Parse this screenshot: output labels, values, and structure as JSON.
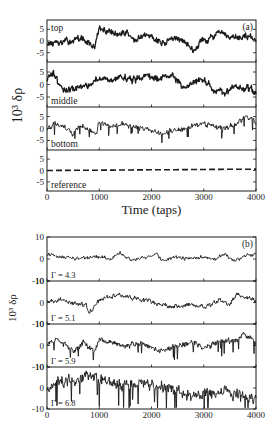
{
  "figure": {
    "width": 279,
    "height": 422,
    "ink_color": "#1a1a1a",
    "background": "#ffffff"
  },
  "chart_data": [
    {
      "type": "line",
      "panel_label": "(a)",
      "title": "",
      "xlabel": "Time (taps)",
      "ylabel": "10³ δρ",
      "xlim": [
        0,
        4000
      ],
      "x_ticks": [
        0,
        1000,
        2000,
        3000,
        4000
      ],
      "x_tick_labels": [
        "0",
        "1000",
        "2000",
        "3000",
        "4000"
      ],
      "grid": false,
      "legend": "none (inline row labels)",
      "frame": {
        "left": 47,
        "right": 256,
        "top": 20,
        "bottom": 191
      },
      "row_bounds": [
        20,
        62,
        107,
        150,
        191
      ],
      "series": [
        {
          "name": "top",
          "ylim": [
            -9,
            9
          ],
          "y_ticks": [
            -5,
            0,
            5
          ],
          "y_tick_labels": [
            "-5",
            "0",
            "5"
          ],
          "noise": 1.6,
          "style": "solid",
          "keypoints": [
            [
              0,
              -1
            ],
            [
              250,
              -1
            ],
            [
              500,
              0.5
            ],
            [
              700,
              1
            ],
            [
              900,
              -3
            ],
            [
              1000,
              5
            ],
            [
              1200,
              4
            ],
            [
              1400,
              2.5
            ],
            [
              1500,
              4
            ],
            [
              1700,
              0
            ],
            [
              1850,
              2
            ],
            [
              2000,
              2.5
            ],
            [
              2200,
              -1
            ],
            [
              2400,
              1
            ],
            [
              2600,
              0.5
            ],
            [
              2800,
              -4
            ],
            [
              2950,
              0
            ],
            [
              3100,
              1
            ],
            [
              3300,
              3.5
            ],
            [
              3500,
              1
            ],
            [
              3700,
              1.5
            ],
            [
              3850,
              2.5
            ],
            [
              4000,
              0
            ]
          ]
        },
        {
          "name": "middle",
          "ylim": [
            -9,
            9
          ],
          "y_ticks": [
            -5,
            0,
            5
          ],
          "y_tick_labels": [
            "-5",
            "0",
            "5"
          ],
          "noise": 1.6,
          "style": "solid",
          "keypoints": [
            [
              0,
              2
            ],
            [
              100,
              5
            ],
            [
              200,
              1
            ],
            [
              400,
              -3
            ],
            [
              600,
              -1
            ],
            [
              800,
              0
            ],
            [
              1000,
              3
            ],
            [
              1200,
              1
            ],
            [
              1300,
              3
            ],
            [
              1500,
              2
            ],
            [
              1700,
              2
            ],
            [
              1900,
              4
            ],
            [
              2000,
              3
            ],
            [
              2200,
              2
            ],
            [
              2400,
              4
            ],
            [
              2600,
              -1
            ],
            [
              2800,
              1
            ],
            [
              3000,
              2
            ],
            [
              3200,
              -2
            ],
            [
              3400,
              -4
            ],
            [
              3600,
              -1
            ],
            [
              3800,
              -1
            ],
            [
              4000,
              -3
            ]
          ]
        },
        {
          "name": "bottom",
          "ylim": [
            -9,
            9
          ],
          "y_ticks": [
            -5,
            0,
            5
          ],
          "y_tick_labels": [
            "-5",
            "0",
            "5"
          ],
          "noise": 1.2,
          "spikes": true,
          "style": "solid",
          "keypoints": [
            [
              0,
              0
            ],
            [
              200,
              2
            ],
            [
              400,
              0
            ],
            [
              500,
              -3
            ],
            [
              600,
              1
            ],
            [
              800,
              0
            ],
            [
              950,
              -3
            ],
            [
              1000,
              3
            ],
            [
              1200,
              1
            ],
            [
              1400,
              2
            ],
            [
              1600,
              1
            ],
            [
              1800,
              0
            ],
            [
              2000,
              -1
            ],
            [
              2200,
              -2
            ],
            [
              2400,
              -1
            ],
            [
              2600,
              0
            ],
            [
              2800,
              1
            ],
            [
              3000,
              2
            ],
            [
              3200,
              1
            ],
            [
              3400,
              0
            ],
            [
              3600,
              2
            ],
            [
              3800,
              5
            ],
            [
              3950,
              3
            ],
            [
              4000,
              2
            ]
          ]
        },
        {
          "name": "reference",
          "ylim": [
            -9,
            9
          ],
          "y_ticks": [
            -5,
            0,
            5
          ],
          "y_tick_labels": [
            "-5",
            "0",
            "5"
          ],
          "noise": 0.0,
          "style": "dashed",
          "keypoints": [
            [
              0,
              0
            ],
            [
              2000,
              0.3
            ],
            [
              4000,
              0.6
            ]
          ]
        }
      ]
    },
    {
      "type": "line",
      "panel_label": "(b)",
      "title": "",
      "xlabel": "",
      "ylabel": "10³ δρ",
      "xlim": [
        0,
        4000
      ],
      "x_ticks": [
        0,
        1000,
        2000,
        3000,
        4000
      ],
      "x_tick_labels": [
        "0",
        "1000",
        "2000",
        "3000",
        "4000"
      ],
      "grid": false,
      "legend": "none (inline row labels)",
      "frame": {
        "left": 47,
        "right": 256,
        "top": 237,
        "bottom": 409
      },
      "row_bounds": [
        237,
        281,
        324,
        367,
        409
      ],
      "series": [
        {
          "name": "Γ = 4.3",
          "ylim": [
            -10,
            10
          ],
          "y_ticks": [
            -10,
            0,
            10
          ],
          "y_tick_labels": [
            "-10",
            "0",
            "10"
          ],
          "noise": 0.9,
          "style": "solid",
          "keypoints": [
            [
              0,
              2
            ],
            [
              300,
              1
            ],
            [
              600,
              0
            ],
            [
              900,
              1
            ],
            [
              1200,
              0
            ],
            [
              1400,
              3
            ],
            [
              1600,
              -0.5
            ],
            [
              1900,
              1
            ],
            [
              2100,
              2.5
            ],
            [
              2200,
              -1
            ],
            [
              2400,
              1
            ],
            [
              2700,
              0
            ],
            [
              3000,
              1
            ],
            [
              3200,
              -0.5
            ],
            [
              3400,
              2
            ],
            [
              3600,
              -1
            ],
            [
              3800,
              1.5
            ],
            [
              4000,
              2
            ]
          ]
        },
        {
          "name": "Γ = 5.1",
          "ylim": [
            -10,
            10
          ],
          "y_ticks": [
            -10,
            0,
            10
          ],
          "y_tick_labels": [
            "-10",
            "0",
            "10"
          ],
          "noise": 1.2,
          "style": "solid",
          "keypoints": [
            [
              0,
              0
            ],
            [
              200,
              1
            ],
            [
              400,
              0
            ],
            [
              600,
              -1
            ],
            [
              750,
              -1
            ],
            [
              800,
              -5
            ],
            [
              1000,
              1
            ],
            [
              1200,
              3
            ],
            [
              1350,
              4
            ],
            [
              1600,
              2
            ],
            [
              1900,
              1
            ],
            [
              2200,
              -1
            ],
            [
              2400,
              -2
            ],
            [
              2700,
              -1
            ],
            [
              3000,
              -2
            ],
            [
              3300,
              1
            ],
            [
              3500,
              -1
            ],
            [
              3650,
              4
            ],
            [
              3800,
              2
            ],
            [
              4000,
              1
            ]
          ]
        },
        {
          "name": "Γ = 5.9",
          "ylim": [
            -10,
            10
          ],
          "y_ticks": [
            -10,
            0,
            10
          ],
          "y_tick_labels": [
            "-10",
            "0",
            "10"
          ],
          "noise": 1.6,
          "spikes": true,
          "style": "solid",
          "keypoints": [
            [
              0,
              0
            ],
            [
              200,
              3
            ],
            [
              500,
              -2
            ],
            [
              700,
              1
            ],
            [
              900,
              -3
            ],
            [
              1000,
              3
            ],
            [
              1200,
              2
            ],
            [
              1500,
              0
            ],
            [
              1800,
              1
            ],
            [
              2000,
              -1
            ],
            [
              2200,
              -3
            ],
            [
              2500,
              0
            ],
            [
              2800,
              1
            ],
            [
              3000,
              -1
            ],
            [
              3300,
              2
            ],
            [
              3600,
              2
            ],
            [
              3750,
              5
            ],
            [
              3900,
              3
            ],
            [
              4000,
              1
            ]
          ]
        },
        {
          "name": "Γ = 6.8",
          "ylim": [
            -10,
            10
          ],
          "y_ticks": [
            -10,
            0,
            10
          ],
          "y_tick_labels": [
            "-10",
            "0",
            "10"
          ],
          "noise": 3.2,
          "spikes": true,
          "style": "solid",
          "keypoints": [
            [
              0,
              -2
            ],
            [
              100,
              2
            ],
            [
              300,
              4
            ],
            [
              600,
              4
            ],
            [
              900,
              5
            ],
            [
              1000,
              3
            ],
            [
              1200,
              2
            ],
            [
              1500,
              1
            ],
            [
              1800,
              2
            ],
            [
              2000,
              2
            ],
            [
              2200,
              0
            ],
            [
              2500,
              -1
            ],
            [
              2800,
              -3
            ],
            [
              3000,
              -3
            ],
            [
              3300,
              -2
            ],
            [
              3600,
              -3
            ],
            [
              3800,
              -4
            ],
            [
              4000,
              -5
            ]
          ]
        }
      ]
    }
  ]
}
